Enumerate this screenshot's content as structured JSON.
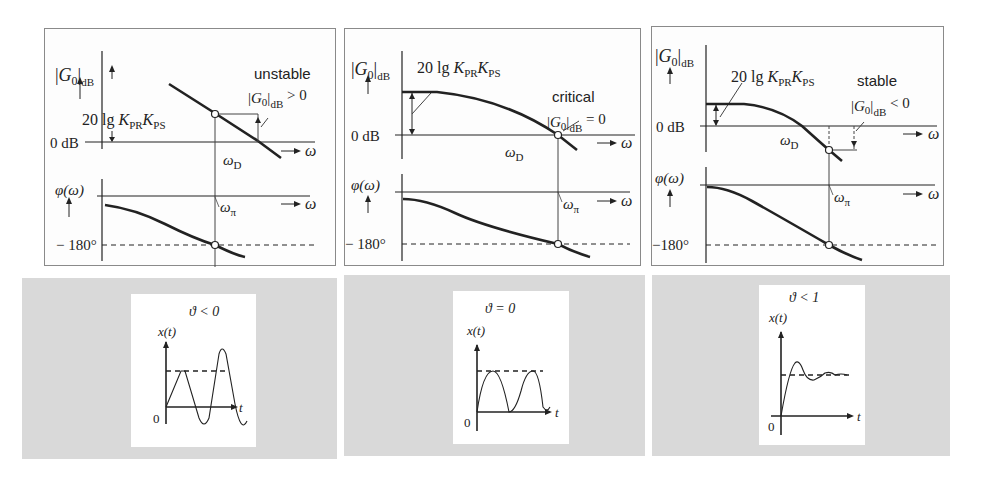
{
  "figure": {
    "top_panels": [
      {
        "id": "unstable",
        "y_axis_label_magnitude": "|G0|dB",
        "gain_label": "20 lg KPR KPS",
        "zero_db_label": "0 dB",
        "omega_label": "ω",
        "omega_d_label": "ωD",
        "phase_axis_label": "φ(ω)",
        "omega_pi_label": "ωπ",
        "minus180_label": "− 180°",
        "case_title": "unstable",
        "case_condition": "|G0|dB > 0"
      },
      {
        "id": "critical",
        "y_axis_label_magnitude": "|G0|dB",
        "gain_label": "20 lg KPR KPS",
        "zero_db_label": "0 dB",
        "omega_label": "ω",
        "omega_d_label": "ωD",
        "phase_axis_label": "φ(ω)",
        "omega_pi_label": "ωπ",
        "minus180_label": "− 180°",
        "case_title": "critical",
        "case_condition": "|G0|dB = 0"
      },
      {
        "id": "stable",
        "y_axis_label_magnitude": "|G0|dB",
        "gain_label": "20 lg KPR KPS",
        "zero_db_label": "0 dB",
        "omega_label": "ω",
        "omega_d_label": "ωD",
        "phase_axis_label": "φ(ω)",
        "omega_pi_label": "ωπ",
        "minus180_label": "−180°",
        "case_title": "stable",
        "case_condition": "|G0|dB < 0"
      }
    ],
    "bottom_panels": [
      {
        "id": "growing",
        "condition": "ϑ < 0",
        "y_label": "x(t)",
        "x_label": "t",
        "origin": "0"
      },
      {
        "id": "sustained",
        "condition": "ϑ = 0",
        "y_label": "x(t)",
        "x_label": "t",
        "origin": "0"
      },
      {
        "id": "damped",
        "condition": "ϑ < 1",
        "y_label": "x(t)",
        "x_label": "t",
        "origin": "0"
      }
    ],
    "colors": {
      "line": "#222222",
      "panel_border": "#8a8a8a",
      "gray_bg": "#d9d9d9"
    }
  }
}
